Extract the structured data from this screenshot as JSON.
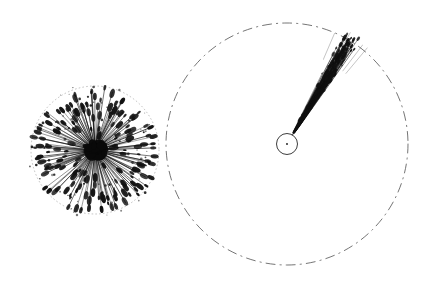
{
  "figure": {
    "title": "",
    "background_color": "#ffffff",
    "ink_color": "#111111",
    "width": 425,
    "height": 283
  },
  "chart_data": {
    "type": "scatter",
    "title": "",
    "subtitle": "",
    "xlabel": "",
    "ylabel": "",
    "xlim": [
      0,
      425
    ],
    "ylim": [
      0,
      283
    ],
    "grid": false,
    "legend": null,
    "annotations": [],
    "panels": [
      {
        "name": "isotropic-burst",
        "center": [
          95,
          150
        ],
        "boundary_radius": 64,
        "boundary_style": "dotted",
        "boundary_color": "#8a8a8a",
        "core_radius": 11,
        "core_color": "#0a0a0a",
        "ray_count": 170,
        "ray_angular_spread_deg": 360,
        "ray_mean_length": 50,
        "ray_length_min": 14,
        "ray_length_max": 64,
        "ray_head_radius_min": 0.9,
        "ray_head_radius_max": 2.6,
        "seed": 1337
      },
      {
        "name": "collimated-jet",
        "center": [
          287,
          144
        ],
        "boundary_radius": 121,
        "boundary_style": "dash-dot",
        "boundary_color": "#4a4a4a",
        "core_circle_radius": 10.5,
        "core_circle_stroke": "#1a1a1a",
        "core_dot_radius": 0.9,
        "jet_axis_angle_deg": -59,
        "jet_angular_spread_deg": 12,
        "jet_start_radius": 12,
        "jet_length_min": 24,
        "jet_length_max": 128,
        "ray_count": 150,
        "ray_head_radius_min": 0.5,
        "ray_head_radius_max": 1.8,
        "seed": 2024
      }
    ]
  }
}
